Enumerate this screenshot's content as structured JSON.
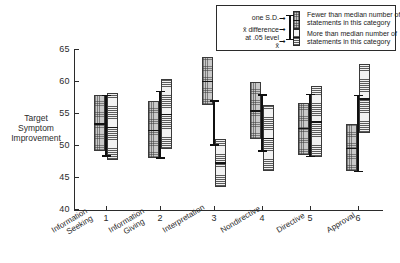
{
  "chart_data": {
    "type": "bar",
    "title": "",
    "xlabel": "",
    "ylabel": "Target Symptom Improvement",
    "ylim": [
      40,
      65
    ],
    "ytick_labels": [
      "65",
      "60",
      "55",
      "50",
      "45",
      "40"
    ],
    "ytick_values": [
      65,
      60,
      55,
      50,
      45,
      40
    ],
    "grid": false,
    "xtick_labels": [
      "1",
      "2",
      "3",
      "4",
      "5",
      "6"
    ],
    "categories": [
      "Information Seeking",
      "Information Giving",
      "Interpretation",
      "Nondirective",
      "Directive",
      "Approval"
    ],
    "category_lines": [
      [
        "Information",
        "Seeking"
      ],
      [
        "Information",
        "Giving"
      ],
      [
        "Interpretation",
        ""
      ],
      [
        "Nondirective",
        ""
      ],
      [
        "Directive",
        ""
      ],
      [
        "Approval",
        ""
      ]
    ],
    "series": [
      {
        "name": "Fewer than median number of statements in this category",
        "key": "fewer",
        "mean": [
          53.4,
          52.4,
          60.0,
          55.4,
          52.7,
          49.5
        ],
        "sd_low": [
          49.0,
          48.0,
          56.3,
          51.0,
          48.5,
          46.0
        ],
        "sd_high": [
          57.8,
          56.8,
          63.7,
          59.9,
          56.6,
          53.3
        ]
      },
      {
        "name": "More than median number of statements in this category",
        "key": "more",
        "mean": [
          52.8,
          54.9,
          47.3,
          51.1,
          53.7,
          57.3
        ],
        "sd_low": [
          47.6,
          49.4,
          43.5,
          46.0,
          48.2,
          51.8
        ],
        "sd_high": [
          58.2,
          60.3,
          51.0,
          56.3,
          59.2,
          62.7
        ]
      }
    ],
    "difference_bars": [
      {
        "category": 1,
        "low": 48.4,
        "high": 57.8
      },
      {
        "category": 2,
        "low": 48.1,
        "high": 58.5
      },
      {
        "category": 3,
        "low": 50.1,
        "high": 57.0
      },
      {
        "category": 4,
        "low": 49.2,
        "high": 57.9
      },
      {
        "category": 5,
        "low": 48.3,
        "high": 58.0
      },
      {
        "category": 6,
        "low": 46.0,
        "high": 57.8
      }
    ]
  },
  "axis": {
    "y_title_lines": [
      "Target",
      "Symptom",
      "Improvement"
    ]
  },
  "legend": {
    "left_labels": {
      "sd": "one S.D.",
      "diff_line1": "x̄ difference",
      "diff_line2": "at  .05 level",
      "mean": "x̄"
    },
    "entries": [
      {
        "swatch": "fewer",
        "line1": "Fewer than median number of",
        "line2": "statements in this category"
      },
      {
        "swatch": "more",
        "line1": "More than median number of",
        "line2": "statements in this category"
      }
    ]
  },
  "colors": {
    "ink": "#2b2b2b",
    "fewer_fill": "#c9c9c9",
    "more_fill": "#f2f2f2",
    "accent_black": "#101010"
  }
}
